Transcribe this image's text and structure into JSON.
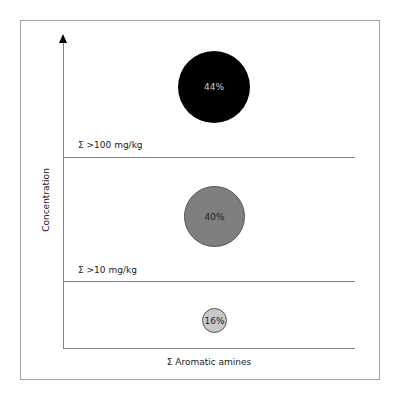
{
  "diagram": {
    "y_axis_label": "Concentration",
    "x_axis_label": "Σ Aromatic amines",
    "thresholds": [
      {
        "label": "Σ >100 mg/kg"
      },
      {
        "label": "Σ >10 mg/kg"
      }
    ],
    "bands": [
      {
        "value": "44%",
        "level": "high",
        "color": "#000000",
        "text_color": "#cccccc"
      },
      {
        "value": "40%",
        "level": "medium",
        "color": "#7f7f7f",
        "text_color": "#222222"
      },
      {
        "value": "16%",
        "level": "low",
        "color": "#c8c8c8",
        "text_color": "#222222"
      }
    ]
  }
}
